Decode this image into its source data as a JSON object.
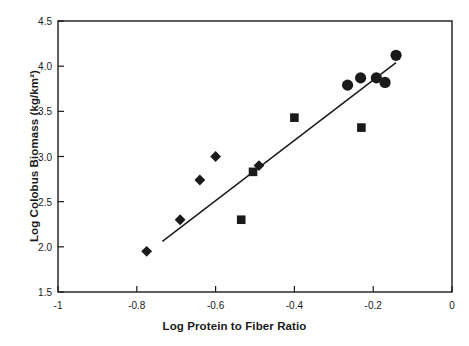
{
  "chart_data": {
    "type": "scatter",
    "title": "",
    "xlabel": "Log Protein to Fiber Ratio",
    "ylabel": "Log Colobus Biomass (kg/km²)",
    "xlim": [
      -1,
      0
    ],
    "ylim": [
      1.5,
      4.5
    ],
    "xticks": [
      -1,
      -0.8,
      -0.6,
      -0.4,
      -0.2,
      0
    ],
    "xtick_labels": [
      "-1",
      "-0.8",
      "-0.6",
      "-0.4",
      "-0.2",
      "0"
    ],
    "yticks": [
      1.5,
      2.0,
      2.5,
      3.0,
      3.5,
      4.0,
      4.5
    ],
    "ytick_labels": [
      "1.5",
      "2.0",
      "2.5",
      "3.0",
      "3.5",
      "4.0",
      "4.5"
    ],
    "grid": false,
    "legend": false,
    "marker_color": "#1a1a1a",
    "line_color": "#1a1a1a",
    "series": [
      {
        "name": "diamond-markers",
        "marker": "diamond",
        "points": [
          {
            "x": -0.775,
            "y": 1.95
          },
          {
            "x": -0.69,
            "y": 2.3
          },
          {
            "x": -0.64,
            "y": 2.74
          },
          {
            "x": -0.6,
            "y": 3.0
          },
          {
            "x": -0.49,
            "y": 2.9
          }
        ]
      },
      {
        "name": "square-markers",
        "marker": "square",
        "points": [
          {
            "x": -0.535,
            "y": 2.3
          },
          {
            "x": -0.505,
            "y": 2.83
          },
          {
            "x": -0.4,
            "y": 3.43
          },
          {
            "x": -0.23,
            "y": 3.32
          }
        ]
      },
      {
        "name": "circle-markers",
        "marker": "circle",
        "points": [
          {
            "x": -0.265,
            "y": 3.79
          },
          {
            "x": -0.232,
            "y": 3.87
          },
          {
            "x": -0.192,
            "y": 3.87
          },
          {
            "x": -0.17,
            "y": 3.82
          },
          {
            "x": -0.142,
            "y": 4.12
          }
        ]
      }
    ],
    "trendline": {
      "name": "regression-line",
      "x_start": -0.735,
      "y_start": 2.06,
      "x_end": -0.142,
      "y_end": 4.04
    }
  }
}
